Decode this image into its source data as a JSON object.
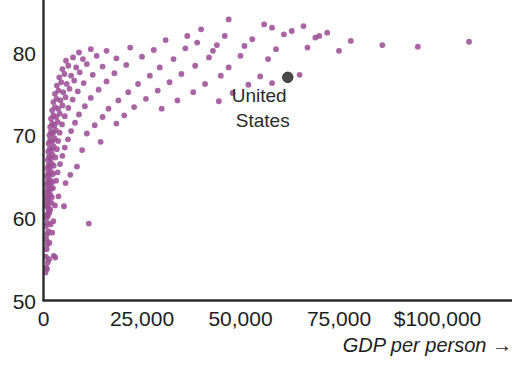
{
  "chart_data": {
    "type": "scatter",
    "title": "",
    "subtitle": "",
    "xlabel": "GDP per person →",
    "ylabel": "",
    "xlim": [
      0,
      120000
    ],
    "ylim": [
      50,
      86
    ],
    "grid": false,
    "legend": null,
    "xticks": [
      0,
      25000,
      50000,
      75000,
      100000
    ],
    "xtick_labels": [
      "0",
      "25,000",
      "50,000",
      "75,000",
      "$100,000"
    ],
    "yticks": [
      50,
      60,
      70,
      80
    ],
    "ytick_labels": [
      "50",
      "60",
      "70",
      "80"
    ],
    "marker_color": "#9d4f96",
    "marker_radius": 2.9,
    "axis_color": "#2b2b2b",
    "annotations": [
      {
        "name": "united-states",
        "label_line1": "United",
        "label_line2": "States",
        "x": 62000,
        "y": 77.0,
        "color": "#4a4a4a",
        "radius": 5.2
      }
    ],
    "series": [
      {
        "name": "countries",
        "color": "#9d4f96",
        "points": [
          [
            500,
            53.4
          ],
          [
            700,
            54.0
          ],
          [
            900,
            53.8
          ],
          [
            1100,
            54.6
          ],
          [
            600,
            55.3
          ],
          [
            1400,
            55.0
          ],
          [
            2600,
            55.4
          ],
          [
            3000,
            55.2
          ],
          [
            800,
            56.2
          ],
          [
            1000,
            56.8
          ],
          [
            700,
            57.4
          ],
          [
            1500,
            57.0
          ],
          [
            900,
            58.0
          ],
          [
            1200,
            58.4
          ],
          [
            2200,
            58.2
          ],
          [
            600,
            59.0
          ],
          [
            1000,
            59.4
          ],
          [
            1800,
            59.2
          ],
          [
            2500,
            59.6
          ],
          [
            11500,
            59.3
          ],
          [
            700,
            60.0
          ],
          [
            900,
            60.4
          ],
          [
            1100,
            60.2
          ],
          [
            1300,
            60.8
          ],
          [
            1500,
            60.6
          ],
          [
            1700,
            61.0
          ],
          [
            800,
            61.4
          ],
          [
            1000,
            61.6
          ],
          [
            1200,
            61.2
          ],
          [
            2000,
            61.8
          ],
          [
            2900,
            61.5
          ],
          [
            5200,
            61.4
          ],
          [
            600,
            62.0
          ],
          [
            900,
            62.4
          ],
          [
            1100,
            62.6
          ],
          [
            1400,
            62.2
          ],
          [
            1700,
            62.8
          ],
          [
            2100,
            62.5
          ],
          [
            3800,
            62.6
          ],
          [
            700,
            63.0
          ],
          [
            1000,
            63.4
          ],
          [
            1300,
            63.2
          ],
          [
            1600,
            63.8
          ],
          [
            1900,
            63.5
          ],
          [
            2400,
            63.6
          ],
          [
            800,
            64.0
          ],
          [
            1100,
            64.4
          ],
          [
            1400,
            64.2
          ],
          [
            1700,
            64.6
          ],
          [
            2200,
            64.3
          ],
          [
            3200,
            64.5
          ],
          [
            5600,
            64.2
          ],
          [
            900,
            65.0
          ],
          [
            1200,
            65.4
          ],
          [
            1500,
            65.2
          ],
          [
            1900,
            65.6
          ],
          [
            2400,
            65.3
          ],
          [
            3600,
            65.5
          ],
          [
            6800,
            65.2
          ],
          [
            1000,
            66.0
          ],
          [
            1300,
            66.4
          ],
          [
            1600,
            66.2
          ],
          [
            2000,
            66.6
          ],
          [
            2600,
            66.3
          ],
          [
            4200,
            66.5
          ],
          [
            8500,
            66.2
          ],
          [
            1100,
            67.0
          ],
          [
            1400,
            67.4
          ],
          [
            1800,
            67.2
          ],
          [
            2300,
            67.6
          ],
          [
            3000,
            67.3
          ],
          [
            4800,
            67.5
          ],
          [
            1200,
            68.0
          ],
          [
            1600,
            68.4
          ],
          [
            2000,
            68.2
          ],
          [
            2600,
            68.6
          ],
          [
            3400,
            68.3
          ],
          [
            5400,
            68.5
          ],
          [
            9800,
            68.2
          ],
          [
            1300,
            69.0
          ],
          [
            1700,
            69.4
          ],
          [
            2200,
            69.2
          ],
          [
            2800,
            69.6
          ],
          [
            3700,
            69.3
          ],
          [
            6200,
            69.5
          ],
          [
            14500,
            69.2
          ],
          [
            1500,
            70.0
          ],
          [
            1900,
            70.4
          ],
          [
            2400,
            70.2
          ],
          [
            3100,
            70.6
          ],
          [
            4100,
            70.3
          ],
          [
            7000,
            70.5
          ],
          [
            11000,
            70.2
          ],
          [
            1700,
            71.0
          ],
          [
            2200,
            71.4
          ],
          [
            2800,
            71.2
          ],
          [
            3600,
            71.6
          ],
          [
            4700,
            71.3
          ],
          [
            8000,
            71.5
          ],
          [
            13000,
            71.2
          ],
          [
            18500,
            71.4
          ],
          [
            1900,
            72.0
          ],
          [
            2500,
            72.4
          ],
          [
            3200,
            72.2
          ],
          [
            4100,
            72.6
          ],
          [
            5400,
            72.3
          ],
          [
            9000,
            72.5
          ],
          [
            15000,
            72.2
          ],
          [
            20500,
            72.4
          ],
          [
            2200,
            73.0
          ],
          [
            2900,
            73.4
          ],
          [
            3700,
            73.2
          ],
          [
            4800,
            73.6
          ],
          [
            6300,
            73.3
          ],
          [
            10500,
            73.5
          ],
          [
            16500,
            73.2
          ],
          [
            23000,
            73.4
          ],
          [
            30000,
            73.2
          ],
          [
            2500,
            74.0
          ],
          [
            3300,
            74.4
          ],
          [
            4300,
            74.2
          ],
          [
            5600,
            74.6
          ],
          [
            7400,
            74.3
          ],
          [
            12000,
            74.5
          ],
          [
            19000,
            74.2
          ],
          [
            26000,
            74.4
          ],
          [
            34000,
            74.2
          ],
          [
            44500,
            74.1
          ],
          [
            2900,
            75.0
          ],
          [
            3800,
            75.4
          ],
          [
            5000,
            75.2
          ],
          [
            6600,
            75.6
          ],
          [
            8700,
            75.3
          ],
          [
            14000,
            75.5
          ],
          [
            21500,
            75.2
          ],
          [
            29000,
            75.4
          ],
          [
            38000,
            75.2
          ],
          [
            48000,
            75.1
          ],
          [
            3400,
            76.0
          ],
          [
            4500,
            76.4
          ],
          [
            5900,
            76.2
          ],
          [
            7800,
            76.6
          ],
          [
            10200,
            76.3
          ],
          [
            16000,
            76.5
          ],
          [
            24000,
            76.2
          ],
          [
            32000,
            76.4
          ],
          [
            41000,
            76.2
          ],
          [
            52000,
            76.1
          ],
          [
            58000,
            76.3
          ],
          [
            4000,
            77.0
          ],
          [
            5300,
            77.4
          ],
          [
            7000,
            77.2
          ],
          [
            9200,
            77.6
          ],
          [
            12500,
            77.3
          ],
          [
            18000,
            77.5
          ],
          [
            27000,
            77.2
          ],
          [
            35000,
            77.4
          ],
          [
            45000,
            77.2
          ],
          [
            55000,
            77.1
          ],
          [
            65000,
            77.3
          ],
          [
            4800,
            78.0
          ],
          [
            6300,
            78.4
          ],
          [
            8300,
            78.2
          ],
          [
            11000,
            78.6
          ],
          [
            15000,
            78.3
          ],
          [
            21000,
            78.5
          ],
          [
            29500,
            78.2
          ],
          [
            38500,
            78.4
          ],
          [
            47000,
            78.2
          ],
          [
            5700,
            79.0
          ],
          [
            7500,
            79.4
          ],
          [
            10000,
            79.2
          ],
          [
            13500,
            79.6
          ],
          [
            18500,
            79.3
          ],
          [
            25000,
            79.5
          ],
          [
            33000,
            79.2
          ],
          [
            42000,
            79.4
          ],
          [
            50000,
            79.6
          ],
          [
            57000,
            79.2
          ],
          [
            9000,
            80.0
          ],
          [
            12000,
            80.4
          ],
          [
            16000,
            80.2
          ],
          [
            22000,
            80.6
          ],
          [
            28000,
            80.3
          ],
          [
            36000,
            80.5
          ],
          [
            43000,
            80.2
          ],
          [
            51000,
            80.8
          ],
          [
            59000,
            80.4
          ],
          [
            67000,
            80.6
          ],
          [
            75000,
            80.2
          ],
          [
            86000,
            80.9
          ],
          [
            95000,
            80.7
          ],
          [
            108000,
            81.3
          ],
          [
            31000,
            81.5
          ],
          [
            39000,
            81.2
          ],
          [
            46000,
            82.0
          ],
          [
            53000,
            81.6
          ],
          [
            61000,
            82.2
          ],
          [
            69000,
            81.8
          ],
          [
            78000,
            81.4
          ],
          [
            40000,
            82.8
          ],
          [
            56000,
            83.4
          ],
          [
            63000,
            82.6
          ],
          [
            72000,
            82.4
          ],
          [
            47000,
            84.0
          ],
          [
            58000,
            83.0
          ],
          [
            66000,
            83.2
          ],
          [
            44000,
            80.9
          ],
          [
            36500,
            82.0
          ],
          [
            70000,
            82.0
          ]
        ]
      }
    ]
  }
}
